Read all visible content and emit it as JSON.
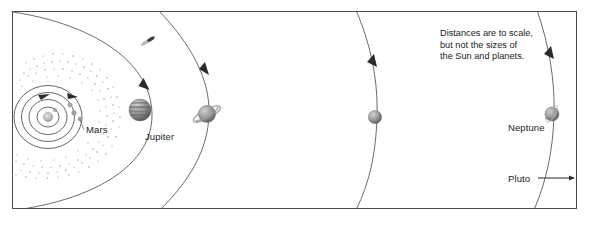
{
  "figure": {
    "frame": {
      "x": 12,
      "y": 11,
      "width": 565,
      "height": 198,
      "stroke": "#3a3a3a"
    },
    "background": "#ffffff",
    "note": {
      "lines": [
        "Distances are to scale,",
        "but not the sizes of",
        "the Sun and planets."
      ]
    },
    "labels": {
      "mars": "Mars",
      "jupiter": "Jupiter",
      "neptune": "Neptune",
      "pluto": "Pluto"
    },
    "bodies": [
      {
        "name": "sun",
        "label": "",
        "cx": 48,
        "cy": 117,
        "r": 4.5,
        "color": "#b8b8b8"
      },
      {
        "name": "mercury",
        "label": "",
        "cx": 56,
        "cy": 110,
        "r": 1.8,
        "color": "#9a9a9a"
      },
      {
        "name": "venus",
        "label": "",
        "cx": 69,
        "cy": 105,
        "r": 2.2,
        "color": "#a5a5a5"
      },
      {
        "name": "earth",
        "label": "",
        "cx": 74,
        "cy": 113,
        "r": 2.3,
        "color": "#9e9e9e"
      },
      {
        "name": "mars",
        "label": "Mars",
        "cx": 80,
        "cy": 121,
        "r": 1.9,
        "color": "#8f8f8f"
      },
      {
        "name": "jupiter",
        "label": "Jupiter",
        "cx": 140,
        "cy": 110,
        "r": 11,
        "color": "#8e8e8e"
      },
      {
        "name": "saturn",
        "label": "",
        "cx": 207,
        "cy": 114,
        "r": 8.5,
        "color": "#9a9a9a"
      },
      {
        "name": "uranus",
        "label": "",
        "cx": 375,
        "cy": 117,
        "r": 6.5,
        "color": "#8b8b8b"
      },
      {
        "name": "neptune",
        "label": "Neptune",
        "cx": 552,
        "cy": 114,
        "r": 7,
        "color": "#a0a0a0"
      }
    ],
    "orbits": [
      {
        "name": "mercury-orbit",
        "type": "ellipse",
        "rx": 11,
        "ry": 11
      },
      {
        "name": "venus-orbit",
        "type": "ellipse",
        "rx": 18,
        "ry": 17
      },
      {
        "name": "earth-orbit",
        "type": "ellipse",
        "rx": 26,
        "ry": 24
      },
      {
        "name": "mars-orbit",
        "type": "ellipse",
        "rx": 34,
        "ry": 32
      },
      {
        "name": "jupiter-orbit",
        "type": "arc"
      },
      {
        "name": "saturn-orbit",
        "type": "arc"
      },
      {
        "name": "uranus-orbit",
        "type": "arc"
      },
      {
        "name": "neptune-orbit",
        "type": "arc"
      }
    ],
    "asteroid_belt": {
      "name": "asteroid-belt",
      "inner_r": 48,
      "outer_r": 70
    },
    "comet": {
      "name": "comet",
      "x": 148,
      "y": 40
    },
    "pluto_arrow": {
      "from_x": 538,
      "to_x": 575,
      "y": 178
    },
    "handwriting": [
      {
        "text": "fire",
        "id": "hw-1"
      },
      {
        "text": "rock sediments",
        "id": "hw-2"
      }
    ]
  }
}
